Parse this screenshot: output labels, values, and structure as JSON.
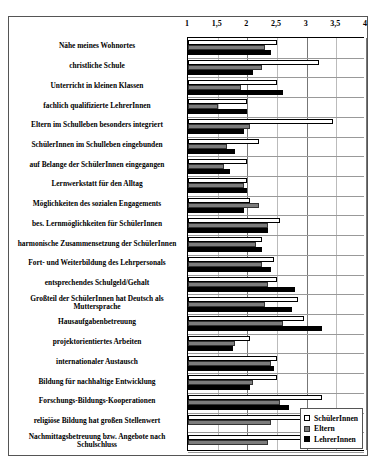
{
  "chart_data": {
    "type": "bar",
    "orientation": "horizontal",
    "title": "",
    "xlabel": "",
    "ylabel": "",
    "xlim": [
      1,
      4
    ],
    "xticks": [
      1,
      1.5,
      2,
      2.5,
      3,
      3.5,
      4
    ],
    "xtick_labels": [
      "1",
      "1,5",
      "2",
      "2,5",
      "3",
      "3,5",
      "4"
    ],
    "grid": true,
    "legend_position": "bottom-right",
    "categories": [
      "Nähe meines Wohnortes",
      "christliche Schule",
      "Unterricht in kleinen Klassen",
      "fachlich qualifizierte LehrerInnen",
      "Eltern im Schulleben besonders integriert",
      "SchülerInnen im Schulleben eingebunden",
      "auf Belange der SchülerInnen eingegangen",
      "Lernwerkstatt für den Alltag",
      "Möglichkeiten des sozialen Engagements",
      "bes. Lernmöglichkeiten für SchülerInnen",
      "harmonische Zusammensetzung der SchülerInnen",
      "Fort- und Weiterbildung des Lehrpersonals",
      "entsprechendes Schulgeld/Gehalt",
      "Großteil der SchülerInnen hat Deutsch als Muttersprache",
      "Hausaufgabenbetreuung",
      "projektorientiertes Arbeiten",
      "internationaler Austausch",
      "Bildung für nachhaltige Entwicklung",
      "Forschungs-Bildungs-Kooperationen",
      "religiöse Bildung hat großen Stellenwert",
      "Nachmittagsbetreuung bzw. Angebote nach Schulschluss"
    ],
    "series": [
      {
        "name": "SchülerInnen",
        "color": "#ffffff",
        "values": [
          2.5,
          3.2,
          2.5,
          2.0,
          3.45,
          2.2,
          2.0,
          2.0,
          2.05,
          2.55,
          2.25,
          2.45,
          2.5,
          2.85,
          2.95,
          2.05,
          2.5,
          2.5,
          3.25,
          3.0,
          3.05
        ]
      },
      {
        "name": "Eltern",
        "color": "#7c7c7c",
        "values": [
          2.3,
          2.25,
          1.9,
          1.5,
          2.05,
          1.65,
          1.6,
          1.95,
          2.2,
          2.35,
          2.15,
          2.25,
          2.35,
          2.3,
          2.6,
          1.8,
          2.4,
          2.1,
          2.55,
          2.4,
          2.35
        ]
      },
      {
        "name": "LehrerInnen",
        "color": "#000000",
        "values": [
          2.4,
          2.1,
          2.6,
          2.0,
          1.95,
          1.8,
          1.7,
          2.0,
          1.95,
          2.35,
          2.25,
          2.4,
          2.8,
          2.75,
          3.25,
          1.75,
          2.45,
          2.05,
          2.7,
          null,
          null
        ]
      }
    ]
  },
  "legend": {
    "items": [
      {
        "label": "SchülerInnen",
        "style": "s-white"
      },
      {
        "label": "Eltern",
        "style": "s-gray"
      },
      {
        "label": "LehrerInnen",
        "style": "s-black"
      }
    ]
  }
}
